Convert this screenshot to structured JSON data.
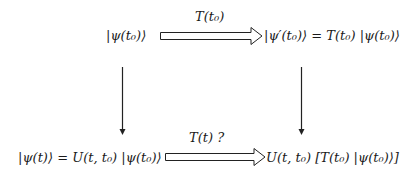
{
  "diagram": {
    "nodes": {
      "top_left": "|ψ(t₀)⟩",
      "top_right": "|ψ′(t₀)⟩ = T(t₀) |ψ(t₀)⟩",
      "bottom_left": "|ψ(t)⟩ = U(t, t₀) |ψ(t₀)⟩",
      "bottom_right": "U(t, t₀)  [T(t₀) |ψ(t₀)⟩]"
    },
    "edges": {
      "top": {
        "label": "T(t₀)",
        "style": "double-arrow"
      },
      "bottom": {
        "label": "T(t) ?",
        "style": "double-arrow"
      },
      "left": {
        "label": "",
        "style": "single-arrow-down"
      },
      "right": {
        "label": "",
        "style": "single-arrow-down"
      }
    }
  }
}
